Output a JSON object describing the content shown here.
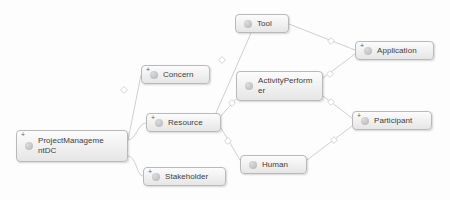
{
  "diagram": {
    "background_color": "#fdfdfd",
    "node_border_color": "#b9b9b9",
    "node_fill_color": "#f2f2f2",
    "edge_color": "#c9c9c9",
    "label_color": "#3d3d3d",
    "icon_color": "#c4c4c4",
    "expander_symbol": "+",
    "icon_name": "class-circle-icon"
  },
  "nodes": [
    {
      "id": "projectmanagementdc",
      "label": "ProjectManageme\nntDC",
      "has_expander": true,
      "x": 16,
      "y": 130,
      "width": 112,
      "height": 32,
      "two_line": true
    },
    {
      "id": "concern",
      "label": "Concern",
      "has_expander": true,
      "x": 141,
      "y": 65,
      "width": 69,
      "height": 19,
      "two_line": false
    },
    {
      "id": "resource",
      "label": "Resource",
      "has_expander": true,
      "x": 146,
      "y": 113,
      "width": 75,
      "height": 19,
      "two_line": false
    },
    {
      "id": "stakeholder",
      "label": "Stakeholder",
      "has_expander": true,
      "x": 143,
      "y": 167,
      "width": 83,
      "height": 19,
      "two_line": false
    },
    {
      "id": "tool",
      "label": "Tool",
      "has_expander": false,
      "x": 235,
      "y": 14,
      "width": 54,
      "height": 19,
      "two_line": false
    },
    {
      "id": "activityperformer",
      "label": "ActivityPerform\ner",
      "has_expander": false,
      "x": 236,
      "y": 71,
      "width": 87,
      "height": 30,
      "two_line": true
    },
    {
      "id": "human",
      "label": "Human",
      "has_expander": false,
      "x": 240,
      "y": 155,
      "width": 67,
      "height": 19,
      "two_line": false
    },
    {
      "id": "application",
      "label": "Application",
      "has_expander": true,
      "x": 355,
      "y": 41,
      "width": 79,
      "height": 19,
      "two_line": false
    },
    {
      "id": "participant",
      "label": "Participant",
      "has_expander": true,
      "x": 352,
      "y": 111,
      "width": 80,
      "height": 19,
      "two_line": false
    }
  ],
  "edges": [
    {
      "id": "pmdc-concern",
      "from": "projectmanagementdc",
      "to": "concern",
      "path": "M 128 140 L 141 75",
      "marker": "arrow",
      "marker_x": 124,
      "marker_y": 90
    },
    {
      "id": "pmdc-resource",
      "from": "projectmanagementdc",
      "to": "resource",
      "path": "M 128 140 C 136 140 138 123 146 123",
      "marker": "none"
    },
    {
      "id": "pmdc-stakeholder",
      "from": "projectmanagementdc",
      "to": "stakeholder",
      "path": "M 128 156 C 136 156 137 176 143 176",
      "marker": "none"
    },
    {
      "id": "tool-resource",
      "from": "tool",
      "to": "resource",
      "path": "M 251 33 L 216 113",
      "marker": "arrow",
      "marker_x": 222,
      "marker_y": 60
    },
    {
      "id": "tool-application",
      "from": "tool",
      "to": "application",
      "path": "M 289 24 L 355 50",
      "marker": "arrow",
      "marker_x": 331,
      "marker_y": 41
    },
    {
      "id": "application-activityperformer",
      "from": "application",
      "to": "activityperformer",
      "path": "M 355 54 L 323 78",
      "marker": "arrow",
      "marker_x": 330,
      "marker_y": 74
    },
    {
      "id": "resource-activityperformer",
      "from": "resource",
      "to": "activityperformer",
      "path": "M 221 116 L 236 99",
      "marker": "arrow",
      "marker_x": 232,
      "marker_y": 103
    },
    {
      "id": "resource-human",
      "from": "resource",
      "to": "human",
      "path": "M 221 128 L 240 160",
      "marker": "arrow",
      "marker_x": 228,
      "marker_y": 141
    },
    {
      "id": "activityperformer-participant",
      "from": "activityperformer",
      "to": "participant",
      "path": "M 323 96 L 352 118",
      "marker": "arrow",
      "marker_x": 331,
      "marker_y": 102
    },
    {
      "id": "participant-human",
      "from": "participant",
      "to": "human",
      "path": "M 352 126 L 307 160",
      "marker": "arrow",
      "marker_x": 334,
      "marker_y": 140
    }
  ]
}
